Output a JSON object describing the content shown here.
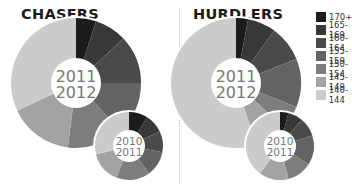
{
  "titles": {
    "left": "CHASERS",
    "right": "HURDLERS"
  },
  "legend": [
    {
      "label": "170+",
      "color": "#1c1c1c"
    },
    {
      "label": "165-169",
      "color": "#383838"
    },
    {
      "label": "160-164",
      "color": "#4a4a4a"
    },
    {
      "label": "155-159",
      "color": "#636363"
    },
    {
      "label": "150-154",
      "color": "#7d7d7d"
    },
    {
      "label": "145-149",
      "color": "#a3a3a3"
    },
    {
      "label": "140-144",
      "color": "#cbcbcb"
    }
  ],
  "chart_data": [
    {
      "type": "pie",
      "title": "CHASERS",
      "subtitle": "2011 2012",
      "categories": [
        "170+",
        "165-169",
        "160-164",
        "155-159",
        "150-154",
        "145-149",
        "140-144"
      ],
      "values": [
        5,
        8,
        12,
        13,
        14,
        16,
        32
      ],
      "center_label": [
        "2011",
        "2012"
      ]
    },
    {
      "type": "pie",
      "title": "CHASERS",
      "subtitle": "2010 2011",
      "categories": [
        "170+",
        "165-169",
        "160-164",
        "155-159",
        "150-154",
        "145-149",
        "140-144"
      ],
      "values": [
        9,
        9,
        10,
        12,
        16,
        15,
        29
      ],
      "center_label": [
        "2010",
        "2011"
      ]
    },
    {
      "type": "pie",
      "title": "HURDLERS",
      "subtitle": "2011 2012",
      "categories": [
        "170+",
        "165-169",
        "160-164",
        "155-159",
        "150-154",
        "145-149",
        "140-144"
      ],
      "values": [
        3,
        7,
        9,
        12,
        6,
        8,
        55
      ],
      "center_label": [
        "2011",
        "2012"
      ]
    },
    {
      "type": "pie",
      "title": "HURDLERS",
      "subtitle": "2010 2011",
      "categories": [
        "170+",
        "165-169",
        "160-164",
        "155-159",
        "150-154",
        "145-149",
        "140-144"
      ],
      "values": [
        4,
        7,
        9,
        14,
        12,
        14,
        40
      ],
      "center_label": [
        "2010",
        "2011"
      ]
    }
  ],
  "pies_layout": [
    {
      "cx": 76,
      "cy": 83,
      "r": 65,
      "hole": 25,
      "fontSize": 16
    },
    {
      "cx": 129,
      "cy": 146,
      "r": 34,
      "hole": 16,
      "fontSize": 10.5
    },
    {
      "cx": 236,
      "cy": 83,
      "r": 65,
      "hole": 25,
      "fontSize": 16
    },
    {
      "cx": 280,
      "cy": 146,
      "r": 34,
      "hole": 16,
      "fontSize": 10.5
    }
  ]
}
